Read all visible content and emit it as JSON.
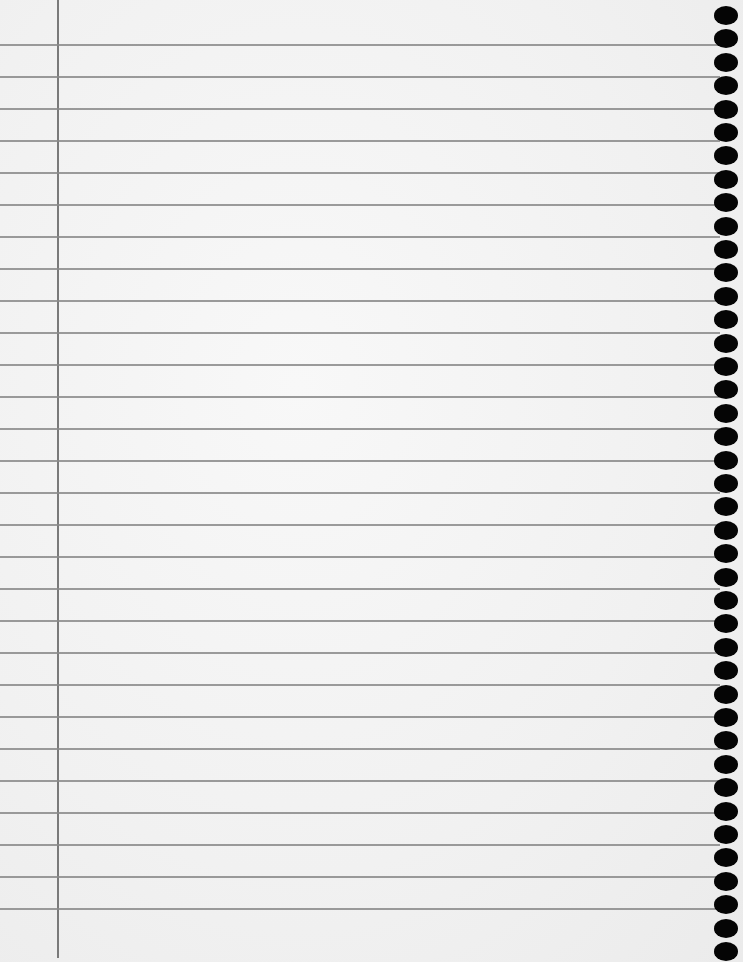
{
  "page": {
    "type": "lined-notebook-paper",
    "colors": {
      "paper": "#f3f3f3",
      "rule": "#8a8a8a",
      "margin": "#7a7a7a",
      "hole": "#050505"
    },
    "rule_count": 28,
    "hole_count": 41
  }
}
